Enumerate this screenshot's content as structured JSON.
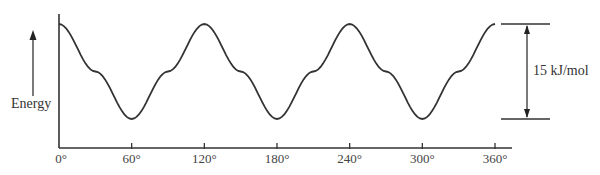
{
  "chart_data": {
    "type": "line",
    "title": "",
    "xlabel": "",
    "ylabel": "Energy",
    "x_ticks": [
      "0°",
      "60°",
      "120°",
      "180°",
      "240°",
      "300°",
      "360°"
    ],
    "x_tick_values": [
      0,
      60,
      120,
      180,
      240,
      300,
      360
    ],
    "xlim": [
      0,
      360
    ],
    "ylim": [
      0,
      15
    ],
    "grid": false,
    "series": [
      {
        "name": "Energy vs dihedral angle",
        "x": [
          0,
          30,
          60,
          90,
          120,
          150,
          180,
          210,
          240,
          270,
          300,
          330,
          360
        ],
        "values": [
          15,
          7.5,
          0,
          7.5,
          15,
          7.5,
          0,
          7.5,
          15,
          7.5,
          0,
          7.5,
          15
        ]
      }
    ],
    "annotations": [
      {
        "type": "dimension-arrow",
        "text": "15 kJ/mol",
        "from": 0,
        "to": 15
      }
    ],
    "color": "#333333"
  },
  "labels": {
    "ylabel": "Energy",
    "barrier": "15 kJ/mol"
  }
}
